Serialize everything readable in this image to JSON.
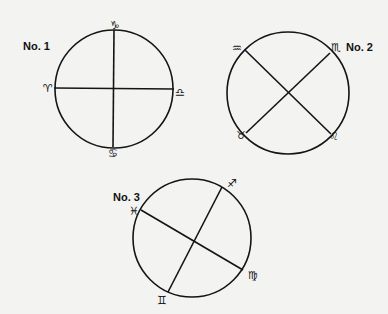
{
  "diagrams": [
    {
      "label": "No. 1",
      "label_pos": {
        "x": 23,
        "y": 41
      },
      "circle": {
        "cx": 114,
        "cy": 89,
        "r": 59
      },
      "lines": [
        {
          "from": "Aries",
          "to": "Libra"
        },
        {
          "from": "Capricorn",
          "to": "Cancer"
        }
      ],
      "signs": [
        {
          "name": "Capricorn",
          "glyph": "♑",
          "x": 115,
          "y": 25
        },
        {
          "name": "Aries",
          "glyph": "♈",
          "x": 48,
          "y": 88
        },
        {
          "name": "Libra",
          "glyph": "♎",
          "x": 180,
          "y": 92
        },
        {
          "name": "Cancer",
          "glyph": "♋",
          "x": 113,
          "y": 153
        }
      ],
      "endpoints": {
        "Capricorn": [
          114,
          30
        ],
        "Cancer": [
          113,
          147
        ],
        "Aries": [
          54,
          88
        ],
        "Libra": [
          174,
          89
        ]
      }
    },
    {
      "label": "No. 2",
      "label_pos": {
        "x": 346,
        "y": 42
      },
      "circle": {
        "cx": 288,
        "cy": 93,
        "r": 61
      },
      "lines": [
        {
          "from": "Aquarius",
          "to": "Leo"
        },
        {
          "from": "Scorpio",
          "to": "Taurus"
        }
      ],
      "signs": [
        {
          "name": "Aquarius",
          "glyph": "♒",
          "x": 237,
          "y": 48
        },
        {
          "name": "Scorpio",
          "glyph": "♏",
          "x": 336,
          "y": 47
        },
        {
          "name": "Taurus",
          "glyph": "♉",
          "x": 241,
          "y": 135
        },
        {
          "name": "Leo",
          "glyph": "♌",
          "x": 334,
          "y": 136
        }
      ],
      "endpoints": {
        "Aquarius": [
          245,
          50
        ],
        "Leo": [
          331,
          134
        ],
        "Scorpio": [
          330,
          53
        ],
        "Taurus": [
          246,
          133
        ]
      }
    },
    {
      "label": "No. 3",
      "label_pos": {
        "x": 113,
        "y": 192
      },
      "circle": {
        "cx": 192,
        "cy": 238,
        "r": 59
      },
      "lines": [
        {
          "from": "Pisces",
          "to": "Virgo"
        },
        {
          "from": "Sagittarius",
          "to": "Gemini"
        }
      ],
      "signs": [
        {
          "name": "Sagittarius",
          "glyph": "♐",
          "x": 232,
          "y": 183
        },
        {
          "name": "Pisces",
          "glyph": "♓",
          "x": 134,
          "y": 211
        },
        {
          "name": "Virgo",
          "glyph": "♍",
          "x": 253,
          "y": 275
        },
        {
          "name": "Gemini",
          "glyph": "♊",
          "x": 162,
          "y": 300
        }
      ],
      "endpoints": {
        "Pisces": [
          141,
          210
        ],
        "Virgo": [
          243,
          270
        ],
        "Sagittarius": [
          222,
          187
        ],
        "Gemini": [
          168,
          292
        ]
      }
    }
  ],
  "colors": {
    "ink": "#141414",
    "paper": "#f3f3f2"
  }
}
